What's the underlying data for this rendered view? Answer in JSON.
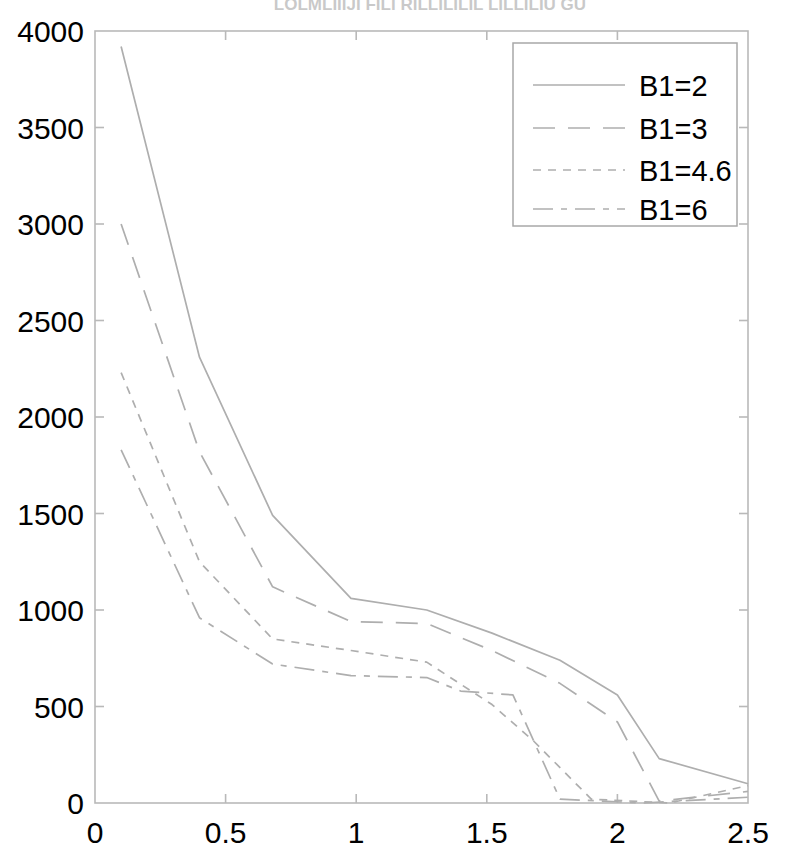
{
  "figure": {
    "clipped_title": "LOLMLIIIJI FILI RILLILILIL LILLILIU GU",
    "background_color": "#ffffff",
    "line_color": "#aeaeae",
    "axis_color": "#b9b9b9",
    "text_color": "#000000"
  },
  "chart_data": {
    "type": "line",
    "title": "",
    "xlabel": "",
    "ylabel": "",
    "xlim": [
      0,
      2.5
    ],
    "ylim": [
      0,
      4000
    ],
    "xticks": [
      0,
      0.5,
      1,
      1.5,
      2,
      2.5
    ],
    "xtick_labels": [
      "0",
      "0.5",
      "1",
      "1.5",
      "2",
      "2.5"
    ],
    "yticks": [
      0,
      500,
      1000,
      1500,
      2000,
      2500,
      3000,
      3500,
      4000
    ],
    "ytick_labels": [
      "0",
      "500",
      "1000",
      "1500",
      "2000",
      "2500",
      "3000",
      "3500",
      "4000"
    ],
    "grid": false,
    "legend_position": "upper right",
    "series": [
      {
        "name": "B1=2",
        "linestyle": "solid",
        "dasharray": "",
        "x": [
          0.1,
          0.4,
          0.68,
          0.98,
          1.27,
          1.52,
          1.78,
          2.0,
          2.16,
          2.5
        ],
        "y": [
          3920,
          2310,
          1490,
          1060,
          1000,
          880,
          740,
          560,
          230,
          100
        ]
      },
      {
        "name": "B1=3",
        "linestyle": "long dash",
        "dasharray": "22 13",
        "x": [
          0.1,
          0.4,
          0.68,
          0.98,
          1.27,
          1.52,
          1.78,
          2.0,
          2.16,
          2.5
        ],
        "y": [
          3000,
          1820,
          1120,
          940,
          930,
          790,
          620,
          420,
          10,
          60
        ]
      },
      {
        "name": "B1=4.6",
        "linestyle": "short dash",
        "dasharray": "8 7",
        "x": [
          0.1,
          0.4,
          0.68,
          0.98,
          1.27,
          1.52,
          1.68,
          1.9,
          2.2,
          2.5
        ],
        "y": [
          2230,
          1250,
          850,
          790,
          730,
          510,
          320,
          20,
          0,
          90
        ]
      },
      {
        "name": "B1=6",
        "linestyle": "dash dot",
        "dasharray": "20 8 6 8",
        "x": [
          0.1,
          0.4,
          0.68,
          0.98,
          1.27,
          1.4,
          1.6,
          1.78,
          2.1,
          2.5
        ],
        "y": [
          1830,
          960,
          720,
          660,
          650,
          580,
          560,
          20,
          0,
          30
        ]
      }
    ]
  },
  "legend": {
    "entries": [
      {
        "label": "B1=2"
      },
      {
        "label": "B1=3"
      },
      {
        "label": "B1=4.6"
      },
      {
        "label": "B1=6"
      }
    ]
  }
}
